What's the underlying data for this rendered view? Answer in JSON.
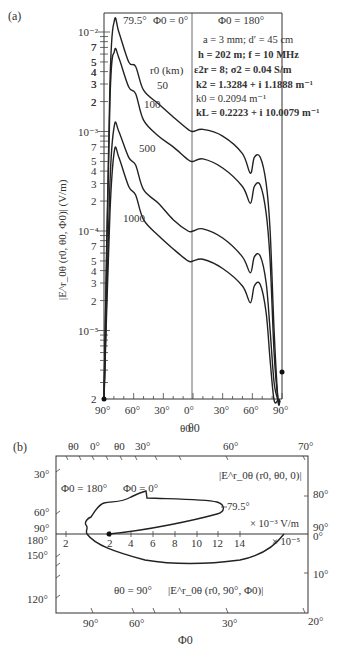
{
  "chart_data": [
    {
      "panel": "(a)",
      "type": "line",
      "title": "",
      "xlabel": "θ0",
      "ylabel": "|E^r_0θ (r0, θ0, Φ0)| (V/m)",
      "yscale": "log",
      "ylim": [
        2e-06,
        0.014
      ],
      "x_tick_labels": [
        "90°",
        "60°",
        "30°",
        "0°",
        "30°",
        "60°",
        "90°"
      ],
      "x_ticks_signed": [
        -90,
        -60,
        -30,
        0,
        30,
        60,
        90
      ],
      "y_decade_labels": [
        "10⁻²",
        "10⁻³",
        "10⁻⁴",
        "10⁻⁵"
      ],
      "y_minor_labels": [
        "7",
        "5",
        "4",
        "3",
        "2"
      ],
      "y_bottom_label": "2",
      "region_labels": {
        "left": "Φ0 = 0°",
        "right": "Φ0 = 180°"
      },
      "peak_annotation": "79.5°",
      "legend_title": "r0 (km)",
      "parameters": [
        "a = 3 mm; d′ = 45 cm",
        "h = 202 m; f = 10 MHz",
        "ε2r = 8; σ2 = 0.04 S/m",
        "k2 = 1.3284 + i 1.1888 m⁻¹",
        "k0 = 0.2094 m⁻¹",
        "kL = 0.2223 + i 10.0079 m⁻¹"
      ],
      "note_x": "negative x = Φ0 = 0° side (θ0 from 90° to 0°), positive x = Φ0 = 180° side",
      "series": [
        {
          "name": "50",
          "label": "50",
          "x": [
            -90,
            -84,
            -79.5,
            -75,
            -65,
            -58,
            -50,
            -35,
            -20,
            -5,
            0,
            10,
            30,
            50,
            58,
            62,
            68,
            74,
            78,
            82,
            86,
            88
          ],
          "y": [
            2e-06,
            0.003,
            0.013,
            0.01,
            0.005,
            0.0045,
            0.0026,
            0.0019,
            0.0014,
            0.00105,
            0.001,
            0.00105,
            0.0009,
            0.0006,
            0.00038,
            0.00055,
            0.00055,
            0.0003,
            0.0001,
            1e-05,
            2e-06,
            2e-06
          ]
        },
        {
          "name": "100",
          "label": "100",
          "x": [
            -90,
            -84,
            -79.5,
            -75,
            -65,
            -58,
            -50,
            -35,
            -20,
            -5,
            0,
            10,
            30,
            50,
            58,
            62,
            68,
            74,
            78,
            82,
            86,
            88
          ],
          "y": [
            2e-06,
            0.002,
            0.0064,
            0.0055,
            0.0028,
            0.0024,
            0.0013,
            0.0009,
            0.0007,
            0.00052,
            0.0005,
            0.00053,
            0.00043,
            0.00028,
            0.00019,
            0.00028,
            0.00029,
            0.00015,
            5e-05,
            6e-06,
            2e-06,
            2e-06
          ]
        },
        {
          "name": "500",
          "label": "500",
          "x": [
            -90,
            -84,
            -79.5,
            -75,
            -65,
            -58,
            -50,
            -35,
            -20,
            -5,
            0,
            10,
            30,
            50,
            58,
            62,
            68,
            74,
            78,
            82,
            86,
            88
          ],
          "y": [
            2e-06,
            0.0003,
            0.00115,
            0.001,
            0.00055,
            0.00046,
            0.00026,
            0.00019,
            0.00013,
            0.0001,
            0.0001,
            0.000105,
            8.5e-05,
            5.5e-05,
            3.8e-05,
            5.5e-05,
            5.6e-05,
            3e-05,
            1e-05,
            3e-06,
            2e-06,
            2e-06
          ]
        },
        {
          "name": "1000",
          "label": "1000",
          "x": [
            -90,
            -84,
            -79.5,
            -75,
            -65,
            -58,
            -50,
            -35,
            -20,
            -5,
            0,
            10,
            30,
            50,
            58,
            62,
            68,
            74,
            78,
            82,
            86,
            88
          ],
          "y": [
            2e-06,
            0.00015,
            0.00064,
            0.00055,
            0.00028,
            0.00023,
            0.00013,
            9e-05,
            6.6e-05,
            5e-05,
            5e-05,
            5.2e-05,
            4.2e-05,
            2.8e-05,
            1.9e-05,
            2.8e-05,
            2.9e-05,
            1.5e-05,
            5e-06,
            2e-06,
            2e-06,
            2e-06
          ]
        }
      ],
      "grid": false
    },
    {
      "panel": "(b)",
      "type": "line",
      "subtype": "polar-pattern on rectangular frame",
      "xlabel": "Φ0",
      "top_axis_label": "θ0",
      "top_tick_labels": [
        "θ0",
        "0°",
        "θ0",
        "30°",
        "60°",
        "70°"
      ],
      "bottom_tick_labels": [
        "90°",
        "60°",
        "30°",
        "20°"
      ],
      "left_tick_labels": [
        "30°",
        "60°",
        "90°",
        "180°",
        "150°",
        "120°"
      ],
      "right_tick_labels": [
        "80°",
        "90°",
        "0°",
        "10°",
        "20°"
      ],
      "horizontal_axis_ticks": [
        "2",
        "2",
        "4",
        "6",
        "8",
        "10",
        "12",
        "14"
      ],
      "unit_upper": "× 10⁻³ V/m",
      "unit_lower": "× 10⁻⁵",
      "annotations": {
        "phi_left": "Φ0 = 180°",
        "phi_right": "Φ0 = 0°",
        "theta_fixed": "θ0 = 90°",
        "upper_curve_label": "|E^r_0θ (r0, θ0, 0)|",
        "lower_curve_label": "|E^r_0θ (r0, 90°, Φ0)|",
        "peak_label": "79.5°"
      },
      "series": [
        {
          "name": "|E^r_0θ (r0, θ0, 0)| (upper lobe, ×10⁻³ V/m)",
          "x": [
            3.2,
            3.0,
            3.3,
            4.0,
            5.0,
            6.0,
            6.2,
            8.0,
            10.0,
            11.5,
            12.3,
            12.2,
            11.0,
            8.0,
            5.0,
            1.6
          ],
          "y_px_offset_above_axis": [
            0,
            8,
            16,
            26,
            30,
            36,
            30,
            30,
            29,
            26,
            22,
            16,
            12,
            8,
            4,
            0
          ]
        },
        {
          "name": "|E^r_0θ (r0, 90°, Φ0)| (lower lobe, ×10⁻⁵)",
          "x": [
            3.2,
            5.0,
            8.0,
            11.0,
            13.5,
            15.0,
            15.8
          ],
          "y_px_offset_below_axis": [
            0,
            12,
            24,
            29,
            26,
            16,
            0
          ]
        }
      ]
    }
  ],
  "labels": {
    "panel_a": "(a)",
    "panel_b": "(b)"
  }
}
